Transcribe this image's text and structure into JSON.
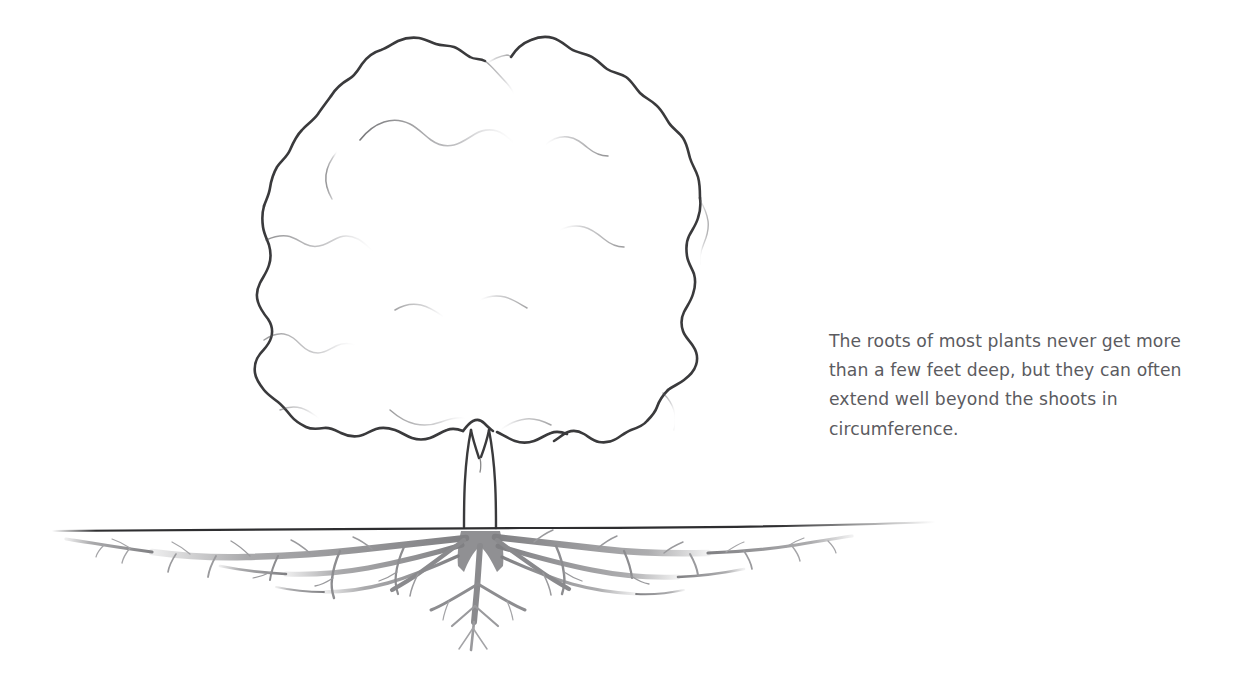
{
  "page": {
    "background_color": "#ffffff",
    "width": 1255,
    "height": 685
  },
  "caption": {
    "text": "The roots of most plants never get more than a few feet deep, but they can often extend well beyond the shoots in circumference.",
    "color": "#5b5b5f"
  },
  "illustration": {
    "title": "tree-with-root-system-diagram",
    "parts": {
      "canopy_label": "tree-canopy",
      "trunk_label": "tree-trunk",
      "ground_label": "ground-line",
      "roots_label": "root-system"
    },
    "colors": {
      "canopy_outline": "#3a3a3c",
      "canopy_inner_line": "#b9b9bd",
      "trunk_outline": "#3a3a3c",
      "ground_line": "#2e2e30",
      "roots": "#8d8d90"
    }
  }
}
